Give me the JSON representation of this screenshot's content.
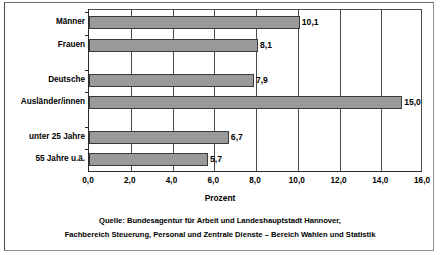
{
  "chart_data": {
    "type": "bar",
    "orientation": "horizontal",
    "title": "",
    "xlabel": "Prozent",
    "ylabel": "",
    "xlim": [
      0.0,
      16.0
    ],
    "xticks": [
      "0,0",
      "2,0",
      "4,0",
      "6,0",
      "8,0",
      "10,0",
      "12,0",
      "14,0",
      "16,0"
    ],
    "xtick_values": [
      0.0,
      2.0,
      4.0,
      6.0,
      8.0,
      10.0,
      12.0,
      14.0,
      16.0
    ],
    "grid": "vertical",
    "legend": "none",
    "bar_color": "#9a9a9a",
    "bar_edge_color": "#3a3a3a",
    "categories": [
      "Männer",
      "Frauen",
      "Deutsche",
      "Ausländer/innen",
      "unter 25 Jahre",
      "55 Jahre u.ä."
    ],
    "values": [
      10.1,
      8.1,
      7.9,
      15.0,
      6.7,
      5.7
    ],
    "value_labels": [
      "10,1",
      "8,1",
      "7,9",
      "15,0",
      "6,7",
      "5,7"
    ],
    "groups": [
      {
        "name": "Geschlecht",
        "categories": [
          "Männer",
          "Frauen"
        ]
      },
      {
        "name": "Staatsangehörigkeit",
        "categories": [
          "Deutsche",
          "Ausländer/innen"
        ]
      },
      {
        "name": "Alter",
        "categories": [
          "unter 25 Jahre",
          "55 Jahre u.ä."
        ]
      }
    ]
  },
  "source": {
    "line1": "Quelle: Bundesagentur für Arbeit und Landeshauptstadt Hannover,",
    "line2": "Fachbereich Steuerung, Personal und Zentrale Dienste – Bereich Wahlen und Statistik"
  }
}
